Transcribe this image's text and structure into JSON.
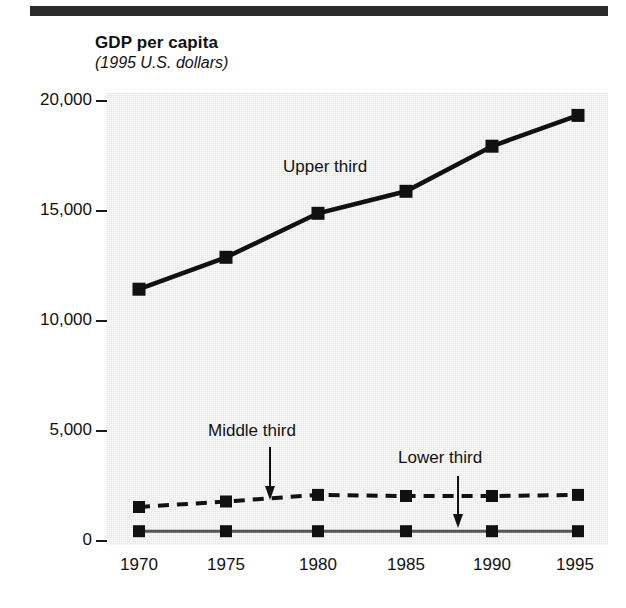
{
  "figure": {
    "title": "GDP per capita",
    "subtitle": "(1995 U.S. dollars)"
  },
  "chart_data": {
    "type": "line",
    "title": "GDP per capita",
    "subtitle": "(1995 U.S. dollars)",
    "xlabel": "",
    "ylabel": "GDP per capita (1995 U.S. dollars)",
    "x": [
      1970,
      1975,
      1980,
      1985,
      1990,
      1995
    ],
    "categories": [
      "1970",
      "1975",
      "1980",
      "1985",
      "1990",
      "1995"
    ],
    "xlim": [
      1968,
      1997
    ],
    "ylim": [
      0,
      20500
    ],
    "yticks": [
      0,
      5000,
      10000,
      15000,
      20000
    ],
    "ytick_labels": [
      "0",
      "5,000",
      "10,000",
      "15,000",
      "20,000"
    ],
    "xticks": [
      1970,
      1975,
      1980,
      1985,
      1990,
      1995
    ],
    "xtick_labels": [
      "1970",
      "1975",
      "1980",
      "1985",
      "1990",
      "1995"
    ],
    "grid": false,
    "legend": "in-plot annotations with arrows",
    "plot_background": "#e7e7e7",
    "series": [
      {
        "name": "Upper third",
        "style": "solid",
        "marker": "square",
        "color": "#111111",
        "values": [
          11400,
          12850,
          14850,
          15850,
          17900,
          19300
        ]
      },
      {
        "name": "Middle third",
        "style": "dashed",
        "marker": "square",
        "color": "#111111",
        "values": [
          1500,
          1750,
          2050,
          2000,
          2000,
          2050
        ]
      },
      {
        "name": "Lower third",
        "style": "solid-thin",
        "marker": "square",
        "color": "#555555",
        "values": [
          400,
          400,
          400,
          400,
          400,
          400
        ]
      }
    ],
    "annotations": [
      {
        "text": "Upper third",
        "points_to": "Upper third",
        "arrow": false
      },
      {
        "text": "Middle third",
        "points_to": "Middle third",
        "arrow": true,
        "arrow_direction": "down"
      },
      {
        "text": "Lower third",
        "points_to": "Lower third",
        "arrow": true,
        "arrow_direction": "down"
      }
    ]
  }
}
